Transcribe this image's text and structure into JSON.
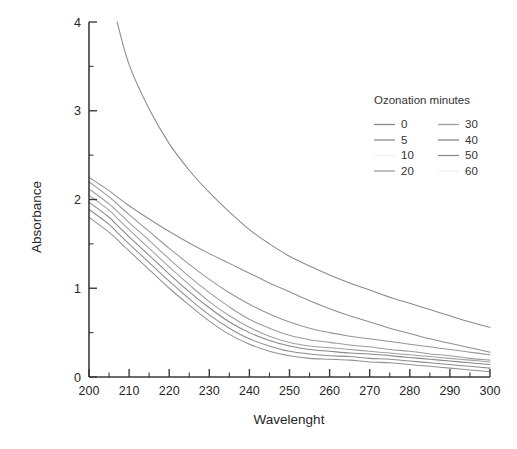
{
  "figure": {
    "background": "#ffffff",
    "frame": {
      "x_left_px": 89,
      "x_right_px": 490,
      "y_top_px": 22,
      "y_bottom_px": 377
    }
  },
  "chart_data": {
    "type": "line",
    "title": "",
    "xlabel": "Wavelenght",
    "ylabel": "Absorbance",
    "xlim": [
      200,
      300
    ],
    "ylim": [
      0,
      4
    ],
    "xticks": [
      200,
      210,
      220,
      230,
      240,
      250,
      260,
      270,
      280,
      290,
      300
    ],
    "yticks": [
      0,
      1,
      2,
      3,
      4
    ],
    "xminor_step": 5,
    "yminor_step": 0.5,
    "grid": false,
    "legend": {
      "title": "Ozonation minutes",
      "position": "upper-right-inside",
      "columns": 2
    },
    "x": [
      200,
      205,
      207,
      210,
      215,
      220,
      225,
      230,
      235,
      240,
      245,
      250,
      255,
      260,
      265,
      270,
      275,
      280,
      285,
      290,
      295,
      300
    ],
    "series": [
      {
        "name": "0",
        "color": "#8a8a8a",
        "values": [
          null,
          null,
          4.0,
          3.52,
          3.02,
          2.63,
          2.33,
          2.08,
          1.86,
          1.66,
          1.5,
          1.36,
          1.25,
          1.15,
          1.06,
          0.98,
          0.9,
          0.83,
          0.76,
          0.69,
          0.62,
          0.56
        ]
      },
      {
        "name": "5",
        "color": "#8f8f8f",
        "values": [
          2.25,
          2.1,
          2.03,
          1.93,
          1.78,
          1.64,
          1.51,
          1.39,
          1.28,
          1.17,
          1.06,
          0.96,
          0.86,
          0.77,
          0.69,
          0.62,
          0.55,
          0.49,
          0.43,
          0.38,
          0.33,
          0.28
        ]
      },
      {
        "name": "10",
        "color": "#969696",
        "values": [
          2.2,
          2.03,
          1.95,
          1.83,
          1.64,
          1.45,
          1.27,
          1.1,
          0.95,
          0.82,
          0.71,
          0.62,
          0.55,
          0.5,
          0.46,
          0.43,
          0.4,
          0.37,
          0.34,
          0.31,
          0.28,
          0.25
        ]
      },
      {
        "name": "20",
        "color": "#9c9c9c",
        "values": [
          2.12,
          1.95,
          1.87,
          1.74,
          1.54,
          1.33,
          1.13,
          0.95,
          0.79,
          0.65,
          0.55,
          0.47,
          0.42,
          0.39,
          0.36,
          0.34,
          0.31,
          0.29,
          0.26,
          0.24,
          0.21,
          0.19
        ]
      },
      {
        "name": "30",
        "color": "#a0a0a0",
        "values": [
          2.05,
          1.88,
          1.79,
          1.66,
          1.45,
          1.24,
          1.04,
          0.85,
          0.69,
          0.56,
          0.46,
          0.39,
          0.35,
          0.33,
          0.31,
          0.29,
          0.27,
          0.25,
          0.23,
          0.21,
          0.19,
          0.17
        ]
      },
      {
        "name": "40",
        "color": "#878787",
        "values": [
          1.97,
          1.8,
          1.71,
          1.58,
          1.37,
          1.16,
          0.96,
          0.78,
          0.62,
          0.5,
          0.41,
          0.35,
          0.31,
          0.29,
          0.27,
          0.26,
          0.24,
          0.22,
          0.2,
          0.18,
          0.16,
          0.14
        ]
      },
      {
        "name": "50",
        "color": "#8d8d8d",
        "values": [
          1.89,
          1.72,
          1.63,
          1.5,
          1.29,
          1.08,
          0.88,
          0.7,
          0.55,
          0.43,
          0.35,
          0.29,
          0.26,
          0.24,
          0.23,
          0.21,
          0.2,
          0.18,
          0.16,
          0.14,
          0.12,
          0.1
        ]
      },
      {
        "name": "60",
        "color": "#929292",
        "values": [
          1.8,
          1.63,
          1.55,
          1.42,
          1.21,
          1.0,
          0.81,
          0.63,
          0.48,
          0.37,
          0.29,
          0.24,
          0.21,
          0.2,
          0.19,
          0.17,
          0.16,
          0.14,
          0.12,
          0.1,
          0.08,
          0.06
        ]
      }
    ]
  }
}
